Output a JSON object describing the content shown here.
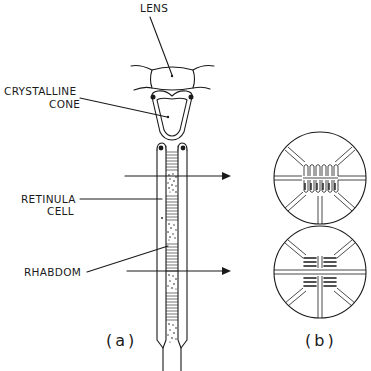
{
  "figure": {
    "labels": {
      "lens": "LENS",
      "crystalline_cone_line1": "CRYSTALLINE",
      "crystalline_cone_line2": "CONE",
      "retinula_cell_line1": "RETINULA",
      "retinula_cell_line2": "CELL",
      "rhabdom": "RHABDOM"
    },
    "panels": {
      "a": "(a)",
      "b": "(b)"
    },
    "cross_sections": [
      {
        "id": "upper",
        "microvilli_orientation": "vertical"
      },
      {
        "id": "lower",
        "microvilli_orientation": "horizontal"
      }
    ],
    "colors": {
      "ink": "#1a1a1a",
      "background": "#ffffff"
    }
  }
}
